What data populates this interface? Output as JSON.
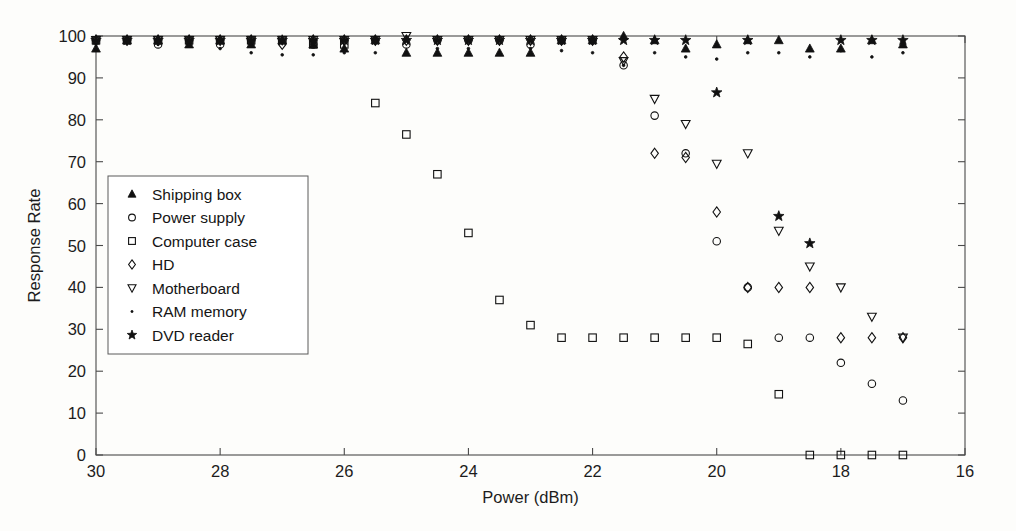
{
  "figure": {
    "background": "#fdfdfb",
    "foreground": "#111111"
  },
  "chart_data": {
    "type": "scatter",
    "title": "",
    "xlabel": "Power (dBm)",
    "ylabel": "Response Rate",
    "xlim": [
      30,
      16
    ],
    "ylim": [
      0,
      100
    ],
    "x_reversed": true,
    "xticks": [
      30,
      28,
      26,
      24,
      22,
      20,
      18,
      16
    ],
    "xticklabels": [
      "30",
      "28",
      "26",
      "24",
      "22",
      "20",
      "18",
      "16"
    ],
    "yticks": [
      0,
      10,
      20,
      30,
      40,
      50,
      60,
      70,
      80,
      90,
      100
    ],
    "yticklabels": [
      "0",
      "10",
      "20",
      "30",
      "40",
      "50",
      "60",
      "70",
      "80",
      "90",
      "100"
    ],
    "grid": false,
    "legend_position": "center-left",
    "marker_color": "#111111",
    "series": [
      {
        "name": "Shipping box",
        "marker": "triangle-up",
        "filled": true,
        "x": [
          30,
          29.5,
          29,
          28.5,
          28,
          27.5,
          27,
          26.5,
          26,
          25.5,
          25,
          24.5,
          24,
          23.5,
          23,
          22.5,
          22,
          21.5,
          21,
          20.5,
          20,
          19.5,
          19,
          18.5,
          18,
          17.5,
          17
        ],
        "y": [
          97,
          99,
          99,
          98,
          99,
          98,
          99,
          98,
          97,
          99,
          96,
          96,
          96,
          96,
          96,
          99,
          99,
          100,
          99,
          97,
          98,
          99,
          99,
          97,
          97,
          99,
          98
        ]
      },
      {
        "name": "Power supply",
        "marker": "circle",
        "filled": false,
        "x": [
          30,
          29.5,
          29,
          28.5,
          28,
          27.5,
          27,
          26.5,
          26,
          25.5,
          25,
          24.5,
          24,
          23.5,
          23,
          22.5,
          22,
          21.5,
          21,
          20.5,
          20,
          19.5,
          19,
          18.5,
          18,
          17.5,
          17
        ],
        "y": [
          99,
          99,
          98,
          99,
          98,
          99,
          99,
          98,
          99,
          99,
          98,
          99,
          99,
          99,
          98,
          99,
          99,
          93,
          81,
          72,
          51,
          40,
          28,
          28,
          22,
          17,
          13
        ]
      },
      {
        "name": "Computer case",
        "marker": "square",
        "filled": false,
        "x": [
          30,
          29.5,
          29,
          28.5,
          28,
          27.5,
          27,
          26.5,
          26,
          25.5,
          25,
          24.5,
          24,
          23.5,
          23,
          22.5,
          22,
          21.5,
          21,
          20.5,
          20,
          19.5,
          19,
          18.5,
          18,
          17.5,
          17
        ],
        "y": [
          99,
          99,
          99,
          99,
          99,
          99,
          99,
          98,
          98,
          84,
          76.5,
          67,
          53,
          37,
          31,
          28,
          28,
          28,
          28,
          28,
          28,
          26.5,
          14.5,
          0,
          0,
          0,
          0
        ]
      },
      {
        "name": "HD",
        "marker": "diamond",
        "filled": false,
        "x": [
          30,
          29.5,
          29,
          28.5,
          28,
          27.5,
          27,
          26.5,
          26,
          25.5,
          25,
          24.5,
          24,
          23.5,
          23,
          22.5,
          22,
          21.5,
          21,
          20.5,
          20,
          19.5,
          19,
          18.5,
          18,
          17.5,
          17
        ],
        "y": [
          99,
          99,
          99,
          99,
          99,
          99,
          98,
          99,
          99,
          99,
          99,
          99,
          99,
          99,
          99,
          99,
          99,
          95,
          72,
          71,
          58,
          40,
          40,
          40,
          28,
          28,
          28
        ]
      },
      {
        "name": "Motherboard",
        "marker": "triangle-down",
        "filled": false,
        "x": [
          30,
          29.5,
          29,
          28.5,
          28,
          27.5,
          27,
          26.5,
          26,
          25.5,
          25,
          24.5,
          24,
          23.5,
          23,
          22.5,
          22,
          21.5,
          21,
          20.5,
          20,
          19.5,
          19,
          18.5,
          18,
          17.5,
          17
        ],
        "y": [
          99,
          99,
          99,
          99,
          99,
          99,
          99,
          99,
          99,
          99,
          100,
          99,
          99,
          99,
          99,
          99,
          99,
          94,
          85,
          79,
          69.5,
          72,
          53.5,
          45,
          40,
          33,
          28
        ]
      },
      {
        "name": "RAM memory",
        "marker": "point",
        "filled": true,
        "x": [
          30,
          29.5,
          29,
          28.5,
          28,
          27.5,
          27,
          26.5,
          26,
          25.5,
          25,
          24.5,
          24,
          23.5,
          23,
          22.5,
          22,
          21.5,
          21,
          20.5,
          20,
          19.5,
          19,
          18.5,
          18,
          17.5,
          17
        ],
        "y": [
          98,
          99,
          98,
          98,
          97,
          96,
          95.5,
          95.5,
          96,
          96,
          96,
          97,
          97,
          96,
          97,
          96.5,
          96,
          93,
          96,
          95,
          94.5,
          96,
          96,
          95,
          96.5,
          95,
          96
        ]
      },
      {
        "name": "DVD reader",
        "marker": "star",
        "filled": true,
        "x": [
          30,
          29.5,
          29,
          28.5,
          28,
          27.5,
          27,
          26.5,
          26,
          25.5,
          25,
          24.5,
          24,
          23.5,
          23,
          22.5,
          22,
          21.5,
          21,
          20.5,
          20,
          19.5,
          19,
          18.5,
          18,
          17.5,
          17
        ],
        "y": [
          99,
          99,
          99,
          99,
          99,
          99,
          99,
          99,
          99,
          99,
          99,
          99,
          99,
          99,
          99,
          99,
          99,
          99,
          99,
          99,
          86.5,
          99,
          57,
          50.5,
          99,
          99,
          99
        ]
      }
    ]
  }
}
